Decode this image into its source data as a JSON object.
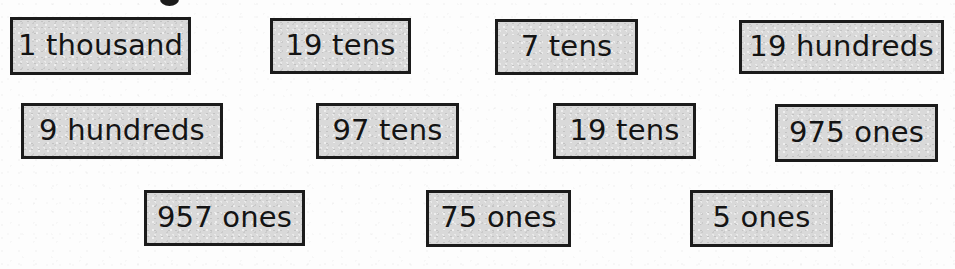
{
  "page": {
    "kind": "maths-worksheet-card-set",
    "background_color": "#fdfdfd",
    "card_fill_color": "#d9d9d9",
    "card_border_color": "#1b1b1b",
    "text_color": "#141414",
    "partial_ink_mark_top": true
  },
  "rows": [
    {
      "row_label": "row-1",
      "cards": [
        {
          "text": "1 thousand",
          "x": 10,
          "y": 17,
          "w": 181,
          "h": 58
        },
        {
          "text": "19 tens",
          "x": 270,
          "y": 18,
          "w": 141,
          "h": 56
        },
        {
          "text": "7 tens",
          "x": 495,
          "y": 19,
          "w": 143,
          "h": 56
        },
        {
          "text": "19 hundreds",
          "x": 739,
          "y": 20,
          "w": 205,
          "h": 54
        }
      ]
    },
    {
      "row_label": "row-2",
      "cards": [
        {
          "text": "9 hundreds",
          "x": 21,
          "y": 103,
          "w": 202,
          "h": 56
        },
        {
          "text": "97 tens",
          "x": 316,
          "y": 103,
          "w": 143,
          "h": 56
        },
        {
          "text": "19 tens",
          "x": 553,
          "y": 103,
          "w": 143,
          "h": 56
        },
        {
          "text": "975 ones",
          "x": 775,
          "y": 104,
          "w": 163,
          "h": 58
        }
      ]
    },
    {
      "row_label": "row-3",
      "cards": [
        {
          "text": "957 ones",
          "x": 144,
          "y": 190,
          "w": 161,
          "h": 56
        },
        {
          "text": "75 ones",
          "x": 426,
          "y": 190,
          "w": 145,
          "h": 57
        },
        {
          "text": "5 ones",
          "x": 690,
          "y": 190,
          "w": 143,
          "h": 57
        }
      ]
    }
  ]
}
